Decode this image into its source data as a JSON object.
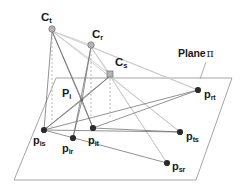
{
  "figure": {
    "background_color": "#ffffff",
    "width": 247,
    "height": 190,
    "colors": {
      "plane_outline": "#9a9a9a",
      "dark_ray": "#6e6e6e",
      "light_ray": "#c8c8c8",
      "dashed_line": "#b0b0b0",
      "plane_point": "#2b2b2b",
      "camera_marker_fill": "#b5b5b5",
      "camera_marker_stroke": "#7a7a7a",
      "text": "#1a1a1a"
    }
  },
  "plane": {
    "name_label": "Plane",
    "symbol": "π",
    "leader_line": true,
    "corners": [
      {
        "name": "top-left",
        "x": 56,
        "y": 78
      },
      {
        "name": "top-right",
        "x": 232,
        "y": 78
      },
      {
        "name": "bottom-right",
        "x": 196,
        "y": 180
      },
      {
        "name": "bottom-left",
        "x": 14,
        "y": 180
      }
    ]
  },
  "cameras": [
    {
      "id": "Ct",
      "base": "C",
      "sub": "t",
      "x": 52,
      "y": 29,
      "label_x": 41,
      "label_y": 12,
      "marker": "circle"
    },
    {
      "id": "Cr",
      "base": "C",
      "sub": "r",
      "x": 91,
      "y": 45,
      "label_x": 92,
      "label_y": 29,
      "marker": "circle"
    },
    {
      "id": "Cs",
      "base": "C",
      "sub": "s",
      "x": 110,
      "y": 74,
      "label_x": 115,
      "label_y": 57,
      "marker": "square"
    }
  ],
  "intersection_point": {
    "id": "Pi",
    "base": "P",
    "sub": "i",
    "x": 82,
    "y": 100,
    "label_x": 62,
    "label_y": 88
  },
  "plane_points": [
    {
      "id": "pis",
      "base": "p",
      "sub": "is",
      "x": 44,
      "y": 130,
      "label_x": 33,
      "label_y": 135
    },
    {
      "id": "pir",
      "base": "p",
      "sub": "ir",
      "x": 73,
      "y": 138,
      "label_x": 62,
      "label_y": 143
    },
    {
      "id": "pit",
      "base": "p",
      "sub": "it",
      "x": 93,
      "y": 128,
      "label_x": 88,
      "label_y": 135
    },
    {
      "id": "prt",
      "base": "p",
      "sub": "rt",
      "x": 198,
      "y": 90,
      "label_x": 204,
      "label_y": 89
    },
    {
      "id": "pts",
      "base": "p",
      "sub": "ts",
      "x": 180,
      "y": 132,
      "label_x": 186,
      "label_y": 131
    },
    {
      "id": "psr",
      "base": "p",
      "sub": "sr",
      "x": 167,
      "y": 163,
      "label_x": 172,
      "label_y": 161
    }
  ],
  "dashed_projection_lines": [
    {
      "from": "Ct",
      "x": 52,
      "y1": 34,
      "y2": 131
    },
    {
      "from": "Cr",
      "x": 91,
      "y1": 50,
      "y2": 118
    },
    {
      "from": "Cs",
      "x": 110,
      "y1": 79,
      "y2": 118
    }
  ],
  "dark_rays": [
    {
      "from": "Ct",
      "to": "pit",
      "x1": 52,
      "y1": 31,
      "x2": 93,
      "y2": 128
    },
    {
      "from": "Ct",
      "to": "pis",
      "x1": 52,
      "y1": 31,
      "x2": 44,
      "y2": 130
    },
    {
      "from": "Ct",
      "to": "Pi",
      "x1": 52,
      "y1": 31,
      "x2": 82,
      "y2": 100
    },
    {
      "from": "Cr",
      "to": "pir",
      "x1": 91,
      "y1": 47,
      "x2": 73,
      "y2": 138
    },
    {
      "from": "Cr",
      "to": "Pi",
      "x1": 91,
      "y1": 47,
      "x2": 82,
      "y2": 100
    },
    {
      "from": "Cs",
      "to": "Pi",
      "x1": 110,
      "y1": 76,
      "x2": 82,
      "y2": 100
    },
    {
      "from": "Cs",
      "to": "pis",
      "x1": 110,
      "y1": 76,
      "x2": 44,
      "y2": 130
    },
    {
      "from": "pis",
      "to": "pts",
      "x1": 44,
      "y1": 130,
      "x2": 180,
      "y2": 132
    },
    {
      "from": "pis",
      "to": "prt",
      "x1": 44,
      "y1": 130,
      "x2": 198,
      "y2": 90
    },
    {
      "from": "pis",
      "to": "psr",
      "x1": 44,
      "y1": 130,
      "x2": 167,
      "y2": 163
    },
    {
      "from": "pit",
      "to": "prt",
      "x1": 93,
      "y1": 128,
      "x2": 198,
      "y2": 90
    },
    {
      "from": "pit",
      "to": "pts",
      "x1": 93,
      "y1": 128,
      "x2": 180,
      "y2": 132
    },
    {
      "from": "Pi",
      "to": "pis",
      "x1": 82,
      "y1": 100,
      "x2": 44,
      "y2": 130
    },
    {
      "from": "Pi",
      "to": "pir",
      "x1": 82,
      "y1": 100,
      "x2": 73,
      "y2": 138
    },
    {
      "from": "Pi",
      "to": "pit",
      "x1": 82,
      "y1": 100,
      "x2": 93,
      "y2": 128
    }
  ],
  "light_rays": [
    {
      "from": "Ct",
      "to": "prt",
      "x1": 52,
      "y1": 31,
      "x2": 198,
      "y2": 90
    },
    {
      "from": "Ct",
      "to": "pts",
      "x1": 52,
      "y1": 31,
      "x2": 180,
      "y2": 132
    },
    {
      "from": "Ct",
      "to": "Cr",
      "x1": 52,
      "y1": 31,
      "x2": 91,
      "y2": 45
    },
    {
      "from": "Ct",
      "to": "Cs",
      "x1": 52,
      "y1": 31,
      "x2": 110,
      "y2": 74
    },
    {
      "from": "Cr",
      "to": "prt",
      "x1": 91,
      "y1": 47,
      "x2": 198,
      "y2": 90
    },
    {
      "from": "Cr",
      "to": "psr",
      "x1": 91,
      "y1": 47,
      "x2": 167,
      "y2": 163
    },
    {
      "from": "Cs",
      "to": "pts",
      "x1": 110,
      "y1": 76,
      "x2": 180,
      "y2": 132
    },
    {
      "from": "Cs",
      "to": "psr",
      "x1": 110,
      "y1": 76,
      "x2": 167,
      "y2": 163
    },
    {
      "from": "Cr",
      "to": "Cs",
      "x1": 91,
      "y1": 47,
      "x2": 110,
      "y2": 74
    }
  ],
  "plane_label_position": {
    "x": 178,
    "y": 48
  },
  "plane_leader": {
    "x1": 206,
    "y1": 62,
    "x2": 200,
    "y2": 79
  }
}
